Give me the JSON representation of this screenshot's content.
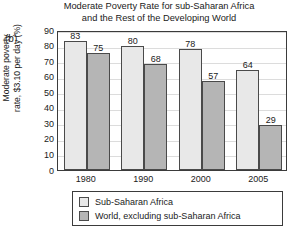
{
  "panel": {
    "label": "(b)"
  },
  "chart_data": {
    "type": "bar",
    "title": "Moderate Poverty Rate for sub-Saharan Africa and the Rest of the Developing World",
    "title_lines": [
      "Moderate Poverty Rate for sub-Saharan Africa",
      "and the Rest of the Developing World"
    ],
    "xlabel": "",
    "ylabel": "Moderate poverty rate, $3.10 per day (%)",
    "ylabel_lines": [
      "Moderate poverty",
      "rate, $3.10 per day (%)"
    ],
    "categories": [
      "1980",
      "1990",
      "2000",
      "2005"
    ],
    "ylim": [
      0,
      90
    ],
    "yticks": [
      0,
      10,
      20,
      30,
      40,
      50,
      60,
      70,
      80,
      90
    ],
    "ytick_labels": [
      "0",
      "10",
      "20",
      "30",
      "40",
      "50",
      "60",
      "70",
      "80",
      "90"
    ],
    "grid": true,
    "legend_position": "bottom",
    "series": [
      {
        "name": "Sub-Saharan Africa",
        "color": "#e8e8e8",
        "values": [
          83,
          80,
          78,
          64
        ],
        "value_labels": [
          "83",
          "80",
          "78",
          "64"
        ]
      },
      {
        "name": "World, excluding sub-Saharan Africa",
        "color": "#b5b5b5",
        "values": [
          75,
          68,
          57,
          29
        ],
        "value_labels": [
          "75",
          "68",
          "57",
          "29"
        ]
      }
    ]
  },
  "colors": {
    "series_light": "#e8e8e8",
    "series_dark": "#b5b5b5",
    "axis": "#3b3b3b",
    "grid": "#dcdcdc",
    "text": "#1a1a1a",
    "background": "#ffffff"
  }
}
